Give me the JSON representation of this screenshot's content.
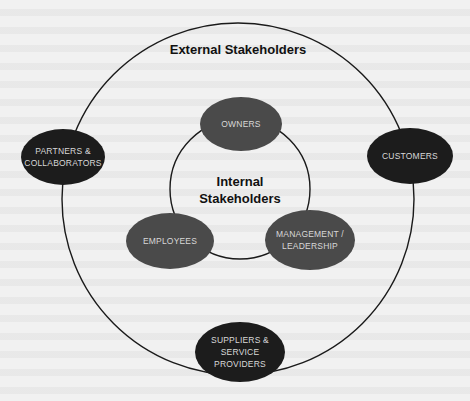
{
  "diagram": {
    "type": "stakeholder-concentric-circles",
    "colors": {
      "background": "#f1f1f1",
      "ring_stroke": "#1a1a1a",
      "external_node_fill": "#1c1c1c",
      "internal_node_fill": "#4a4a4a",
      "node_text": "#d8d8d8",
      "heading_text": "#111111"
    },
    "outer_ring": {
      "label": "External Stakeholders",
      "nodes": [
        {
          "id": "partners",
          "lines": [
            "PARTNERS &",
            "COLLABORATORS"
          ]
        },
        {
          "id": "customers",
          "lines": [
            "CUSTOMERS"
          ]
        },
        {
          "id": "suppliers",
          "lines": [
            "SUPPLIERS &",
            "SERVICE",
            "PROVIDERS"
          ]
        }
      ]
    },
    "inner_ring": {
      "label_lines": [
        "Internal",
        "Stakeholders"
      ],
      "nodes": [
        {
          "id": "owners",
          "lines": [
            "OWNERS"
          ]
        },
        {
          "id": "employees",
          "lines": [
            "EMPLOYEES"
          ]
        },
        {
          "id": "management",
          "lines": [
            "MANAGEMENT /",
            "LEADERSHIP"
          ]
        }
      ]
    }
  }
}
